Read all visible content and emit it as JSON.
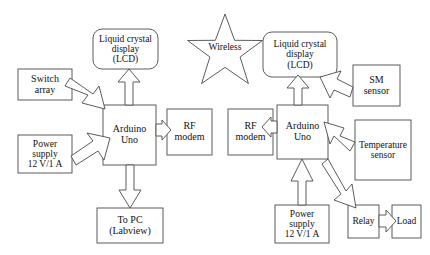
{
  "diagram": {
    "stroke_color": "#4a4a4a",
    "fill_color": "#ffffff",
    "text_color": "#111111",
    "background": "#ffffff",
    "nodes": [
      {
        "id": "switch-array",
        "label_lines": [
          "Switch",
          "array"
        ],
        "shape": "rect"
      },
      {
        "id": "power-supply-left",
        "label_lines": [
          "Power",
          "supply",
          "12 V/1 A"
        ],
        "shape": "rect"
      },
      {
        "id": "lcd-left",
        "label_lines": [
          "Liquid crystal",
          "display",
          "(LCD)"
        ],
        "shape": "rounded-rect"
      },
      {
        "id": "arduino-left",
        "label_lines": [
          "Arduino",
          "Uno"
        ],
        "shape": "rect"
      },
      {
        "id": "rf-modem-left",
        "label_lines": [
          "RF",
          "modem"
        ],
        "shape": "rect"
      },
      {
        "id": "to-pc",
        "label_lines": [
          "To PC",
          "(Labview)"
        ],
        "shape": "rect"
      },
      {
        "id": "wireless-star",
        "label_lines": [
          "Wireless"
        ],
        "shape": "star"
      },
      {
        "id": "rf-modem-right",
        "label_lines": [
          "RF",
          "modem"
        ],
        "shape": "rect"
      },
      {
        "id": "lcd-right",
        "label_lines": [
          "Liquid crystal",
          "display",
          "(LCD)"
        ],
        "shape": "rounded-rect"
      },
      {
        "id": "arduino-right",
        "label_lines": [
          "Arduino",
          "Uno"
        ],
        "shape": "rect"
      },
      {
        "id": "sm-sensor",
        "label_lines": [
          "SM",
          "sensor"
        ],
        "shape": "rect"
      },
      {
        "id": "temperature-sensor",
        "label_lines": [
          "Temperature",
          "sensor"
        ],
        "shape": "rect"
      },
      {
        "id": "power-supply-right",
        "label_lines": [
          "Power",
          "supply",
          "12 V/1 A"
        ],
        "shape": "rect"
      },
      {
        "id": "relay",
        "label_lines": [
          "Relay"
        ],
        "shape": "rect"
      },
      {
        "id": "load",
        "label_lines": [
          "Load"
        ],
        "shape": "rect"
      }
    ],
    "connections": [
      {
        "from": "switch-array",
        "to": "arduino-left",
        "style": "block-arrow"
      },
      {
        "from": "power-supply-left",
        "to": "arduino-left",
        "style": "block-arrow"
      },
      {
        "from": "arduino-left",
        "to": "lcd-left",
        "style": "block-arrow"
      },
      {
        "from": "arduino-left",
        "to": "rf-modem-left",
        "style": "block-arrow"
      },
      {
        "from": "arduino-left",
        "to": "to-pc",
        "style": "block-arrow"
      },
      {
        "from": "rf-modem-right",
        "to": "arduino-right",
        "style": "block-arrow"
      },
      {
        "from": "arduino-right",
        "to": "lcd-right",
        "style": "block-arrow"
      },
      {
        "from": "sm-sensor",
        "to": "arduino-right",
        "style": "block-arrow"
      },
      {
        "from": "temperature-sensor",
        "to": "arduino-right",
        "style": "block-arrow"
      },
      {
        "from": "power-supply-right",
        "to": "arduino-right",
        "style": "block-arrow"
      },
      {
        "from": "arduino-right",
        "to": "relay",
        "style": "block-arrow"
      },
      {
        "from": "relay",
        "to": "load",
        "style": "block-arrow"
      }
    ]
  },
  "labels": {
    "switch_array_l1": "Switch",
    "switch_array_l2": "array",
    "power_left_l1": "Power",
    "power_left_l2": "supply",
    "power_left_l3": "12 V/1 A",
    "lcd_left_l1": "Liquid crystal",
    "lcd_left_l2": "display",
    "lcd_left_l3": "(LCD)",
    "arduino_left_l1": "Arduino",
    "arduino_left_l2": "Uno",
    "rf_left_l1": "RF",
    "rf_left_l2": "modem",
    "to_pc_l1": "To PC",
    "to_pc_l2": "(Labview)",
    "wireless": "Wireless",
    "rf_right_l1": "RF",
    "rf_right_l2": "modem",
    "lcd_right_l1": "Liquid crystal",
    "lcd_right_l2": "display",
    "lcd_right_l3": "(LCD)",
    "arduino_right_l1": "Arduino",
    "arduino_right_l2": "Uno",
    "sm_sensor_l1": "SM",
    "sm_sensor_l2": "sensor",
    "temp_sensor_l1": "Temperature",
    "temp_sensor_l2": "sensor",
    "power_right_l1": "Power",
    "power_right_l2": "supply",
    "power_right_l3": "12 V/1 A",
    "relay": "Relay",
    "load": "Load"
  }
}
